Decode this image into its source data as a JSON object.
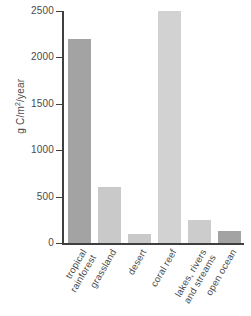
{
  "chart_data": {
    "type": "bar",
    "title": "",
    "xlabel": "",
    "ylabel": "g C/m2/year",
    "ylabel_parts": {
      "pre": "g C/m",
      "sup": "2",
      "post": "/year"
    },
    "ylim": [
      0,
      2500
    ],
    "yticks": [
      0,
      500,
      1000,
      1500,
      2000,
      2500
    ],
    "ytick_labels": [
      "0",
      "500",
      "1000",
      "1500",
      "2000",
      "2500"
    ],
    "grid": false,
    "legend": "none",
    "categories": [
      "tropical rainforest",
      "grassland",
      "desert",
      "coral reef",
      "lakes, rivers and streams",
      "open ocean"
    ],
    "category_lines": [
      [
        "tropical",
        "rainforest"
      ],
      [
        "grassland",
        ""
      ],
      [
        "desert",
        ""
      ],
      [
        "coral reef",
        ""
      ],
      [
        "lakes, rivers",
        "and streams"
      ],
      [
        "open ocean",
        ""
      ]
    ],
    "values": [
      2200,
      600,
      100,
      2500,
      250,
      125
    ],
    "bar_colors": [
      "#a3a3a3",
      "#c9c9c9",
      "#c9c9c9",
      "#d2d2d2",
      "#cccccc",
      "#a3a3a3"
    ]
  },
  "axis_color": "#3f3f3f",
  "text_color": "#4a4a4a",
  "background": "#ffffff"
}
